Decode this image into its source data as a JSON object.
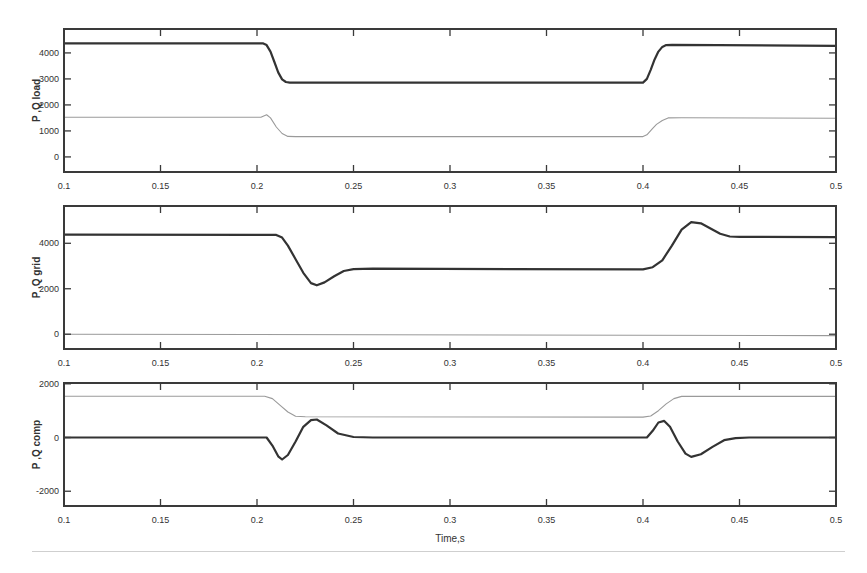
{
  "chart_data": [
    {
      "id": "load",
      "type": "line",
      "ylabel": "P ,Q load",
      "xlabel": "",
      "xlim": [
        0.1,
        0.5
      ],
      "ylim": [
        -580,
        4920
      ],
      "xticks": [
        0.1,
        0.15,
        0.2,
        0.25,
        0.3,
        0.35,
        0.4,
        0.45,
        0.5
      ],
      "xtick_labels": [
        "0.1",
        "0.15",
        "0.2",
        "0.25",
        "0.3",
        "0.35",
        "0.4",
        "0.45",
        "0.5"
      ],
      "yticks": [
        0,
        1000,
        2000,
        3000,
        4000
      ],
      "ytick_labels": [
        "0",
        "1000",
        "2000",
        "3000",
        "4000"
      ],
      "grid": false,
      "series": [
        {
          "name": "P",
          "color": "#333333",
          "style": "thick",
          "points": [
            [
              0.1,
              4370
            ],
            [
              0.203,
              4370
            ],
            [
              0.205,
              4300
            ],
            [
              0.207,
              4050
            ],
            [
              0.209,
              3650
            ],
            [
              0.211,
              3250
            ],
            [
              0.213,
              2980
            ],
            [
              0.215,
              2880
            ],
            [
              0.217,
              2860
            ],
            [
              0.4,
              2860
            ],
            [
              0.402,
              3000
            ],
            [
              0.404,
              3350
            ],
            [
              0.406,
              3750
            ],
            [
              0.408,
              4050
            ],
            [
              0.41,
              4230
            ],
            [
              0.412,
              4300
            ],
            [
              0.415,
              4310
            ],
            [
              0.5,
              4270
            ]
          ]
        },
        {
          "name": "Q",
          "color": "#9a9a9a",
          "style": "thin",
          "points": [
            [
              0.1,
              1525
            ],
            [
              0.202,
              1525
            ],
            [
              0.205,
              1620
            ],
            [
              0.207,
              1500
            ],
            [
              0.21,
              1150
            ],
            [
              0.213,
              900
            ],
            [
              0.216,
              790
            ],
            [
              0.22,
              780
            ],
            [
              0.4,
              780
            ],
            [
              0.402,
              850
            ],
            [
              0.405,
              1100
            ],
            [
              0.407,
              1250
            ],
            [
              0.41,
              1400
            ],
            [
              0.413,
              1500
            ],
            [
              0.42,
              1510
            ],
            [
              0.5,
              1490
            ]
          ]
        }
      ]
    },
    {
      "id": "grid",
      "type": "line",
      "ylabel": "P ,Q grid",
      "xlabel": "",
      "xlim": [
        0.1,
        0.5
      ],
      "ylim": [
        -650,
        5640
      ],
      "xticks": [
        0.1,
        0.15,
        0.2,
        0.25,
        0.3,
        0.35,
        0.4,
        0.45,
        0.5
      ],
      "xtick_labels": [
        "0.1",
        "0.15",
        "0.2",
        "0.25",
        "0.3",
        "0.35",
        "0.4",
        "0.45",
        "0.5"
      ],
      "yticks": [
        0,
        2000,
        4000
      ],
      "ytick_labels": [
        "0",
        "2000",
        "4000"
      ],
      "grid": false,
      "series": [
        {
          "name": "P",
          "color": "#333333",
          "style": "thick",
          "points": [
            [
              0.1,
              4380
            ],
            [
              0.21,
              4370
            ],
            [
              0.213,
              4250
            ],
            [
              0.216,
              3900
            ],
            [
              0.22,
              3300
            ],
            [
              0.224,
              2700
            ],
            [
              0.228,
              2250
            ],
            [
              0.231,
              2150
            ],
            [
              0.235,
              2280
            ],
            [
              0.24,
              2550
            ],
            [
              0.245,
              2780
            ],
            [
              0.25,
              2860
            ],
            [
              0.26,
              2880
            ],
            [
              0.4,
              2850
            ],
            [
              0.405,
              2950
            ],
            [
              0.41,
              3250
            ],
            [
              0.415,
              3900
            ],
            [
              0.42,
              4600
            ],
            [
              0.425,
              4930
            ],
            [
              0.43,
              4880
            ],
            [
              0.435,
              4650
            ],
            [
              0.44,
              4420
            ],
            [
              0.445,
              4300
            ],
            [
              0.45,
              4280
            ],
            [
              0.5,
              4270
            ]
          ]
        },
        {
          "name": "Q",
          "color": "#9a9a9a",
          "style": "thin",
          "points": [
            [
              0.1,
              0
            ],
            [
              0.5,
              -60
            ]
          ]
        }
      ]
    },
    {
      "id": "comp",
      "type": "line",
      "ylabel": "P ,Q comp",
      "xlabel": "Time,s",
      "xlim": [
        0.1,
        0.5
      ],
      "ylim": [
        -2550,
        2030
      ],
      "xticks": [
        0.1,
        0.15,
        0.2,
        0.25,
        0.3,
        0.35,
        0.4,
        0.45,
        0.5
      ],
      "xtick_labels": [
        "0.1",
        "0.15",
        "0.2",
        "0.25",
        "0.3",
        "0.35",
        "0.4",
        "0.45",
        "0.5"
      ],
      "yticks": [
        -2000,
        0,
        2000
      ],
      "ytick_labels": [
        "-2000",
        "0",
        "2000"
      ],
      "grid": false,
      "series": [
        {
          "name": "Q",
          "color": "#9a9a9a",
          "style": "thin",
          "points": [
            [
              0.1,
              1540
            ],
            [
              0.204,
              1540
            ],
            [
              0.208,
              1450
            ],
            [
              0.212,
              1200
            ],
            [
              0.216,
              950
            ],
            [
              0.22,
              790
            ],
            [
              0.225,
              770
            ],
            [
              0.4,
              760
            ],
            [
              0.404,
              800
            ],
            [
              0.408,
              1000
            ],
            [
              0.412,
              1250
            ],
            [
              0.416,
              1450
            ],
            [
              0.42,
              1530
            ],
            [
              0.5,
              1530
            ]
          ]
        },
        {
          "name": "P",
          "color": "#333333",
          "style": "thick",
          "points": [
            [
              0.1,
              0
            ],
            [
              0.205,
              0
            ],
            [
              0.208,
              -300
            ],
            [
              0.211,
              -700
            ],
            [
              0.213,
              -820
            ],
            [
              0.216,
              -650
            ],
            [
              0.22,
              -150
            ],
            [
              0.224,
              400
            ],
            [
              0.228,
              650
            ],
            [
              0.231,
              670
            ],
            [
              0.236,
              450
            ],
            [
              0.242,
              150
            ],
            [
              0.25,
              20
            ],
            [
              0.26,
              0
            ],
            [
              0.402,
              0
            ],
            [
              0.405,
              250
            ],
            [
              0.408,
              560
            ],
            [
              0.411,
              620
            ],
            [
              0.414,
              400
            ],
            [
              0.418,
              -150
            ],
            [
              0.422,
              -600
            ],
            [
              0.425,
              -720
            ],
            [
              0.43,
              -620
            ],
            [
              0.436,
              -350
            ],
            [
              0.442,
              -100
            ],
            [
              0.448,
              -20
            ],
            [
              0.455,
              0
            ],
            [
              0.5,
              0
            ]
          ]
        }
      ]
    }
  ],
  "figure": {
    "xlabel": "Time,s"
  }
}
